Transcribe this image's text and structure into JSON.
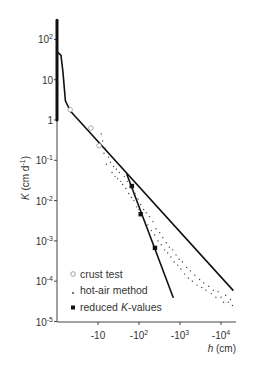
{
  "chart_data": {
    "type": "scatter",
    "title": "",
    "xlabel": "h (cm)",
    "ylabel": "K (cm d-1)",
    "xscale": "log (negative pressure head)",
    "yscale": "log",
    "xlim_abs_h": [
      1,
      22000
    ],
    "ylim": [
      1e-05,
      300
    ],
    "grid": false,
    "legend_position": "bottom-left",
    "x_ticks": [
      {
        "value": 10,
        "base": "-10",
        "exp": ""
      },
      {
        "value": 100,
        "base": "-10",
        "exp": "2"
      },
      {
        "value": 1000,
        "base": "-10",
        "exp": "3"
      },
      {
        "value": 10000,
        "base": "-10",
        "exp": "4"
      }
    ],
    "y_ticks": [
      {
        "value": 100,
        "base": "10",
        "exp": "2"
      },
      {
        "value": 10,
        "base": "10",
        "exp": ""
      },
      {
        "value": 1,
        "base": "1",
        "exp": ""
      },
      {
        "value": 0.1,
        "base": "10",
        "exp": "-1"
      },
      {
        "value": 0.01,
        "base": "10",
        "exp": "-2"
      },
      {
        "value": 0.001,
        "base": "10",
        "exp": "-3"
      },
      {
        "value": 0.0001,
        "base": "10",
        "exp": "-4"
      },
      {
        "value": 1e-05,
        "base": "10",
        "exp": "-5"
      }
    ],
    "ylabel_parts": {
      "k": "K",
      "unit": " (cm d",
      "exp": "-1",
      "close": ")"
    },
    "xlabel_parts": {
      "h": "h",
      "unit": " (cm)"
    },
    "series": [
      {
        "name": "saturated K (near h = 0)",
        "kind": "line",
        "points": [
          [
            1,
            300
          ],
          [
            1,
            1
          ]
        ]
      },
      {
        "name": "wet-range curve",
        "kind": "line",
        "points": [
          [
            1,
            50
          ],
          [
            1.25,
            40
          ],
          [
            1.4,
            15
          ],
          [
            1.6,
            3
          ],
          [
            1.9,
            2.1
          ],
          [
            2.2,
            1.6
          ]
        ]
      },
      {
        "name": "fitted line (hot-air method)",
        "kind": "line",
        "points": [
          [
            2.2,
            1.6
          ],
          [
            19500,
            6e-05
          ]
        ]
      },
      {
        "name": "fitted line (reduced K-values)",
        "kind": "line",
        "points": [
          [
            51,
            0.044
          ],
          [
            680,
            4e-05
          ]
        ]
      },
      {
        "name": "crust test",
        "kind": "marker",
        "marker": "open-circle",
        "points": [
          [
            2.1,
            1.8
          ],
          [
            6.7,
            0.63
          ],
          [
            10.6,
            0.23
          ]
        ]
      },
      {
        "name": "reduced K-values",
        "kind": "marker",
        "marker": "filled-square",
        "points": [
          [
            67,
            0.023
          ],
          [
            110,
            0.0046
          ],
          [
            245,
            0.00067
          ]
        ]
      },
      {
        "name": "hot-air method",
        "kind": "marker",
        "marker": "dot",
        "points": [
          [
            12,
            0.45
          ],
          [
            13,
            0.3
          ],
          [
            14,
            0.15
          ],
          [
            15,
            0.2
          ],
          [
            16,
            0.08
          ],
          [
            18,
            0.12
          ],
          [
            20,
            0.09
          ],
          [
            22,
            0.05
          ],
          [
            24,
            0.07
          ],
          [
            26,
            0.04
          ],
          [
            28,
            0.06
          ],
          [
            30,
            0.035
          ],
          [
            33,
            0.05
          ],
          [
            36,
            0.03
          ],
          [
            40,
            0.025
          ],
          [
            44,
            0.04
          ],
          [
            48,
            0.02
          ],
          [
            52,
            0.03
          ],
          [
            56,
            0.015
          ],
          [
            60,
            0.022
          ],
          [
            65,
            0.012
          ],
          [
            70,
            0.018
          ],
          [
            75,
            0.01
          ],
          [
            80,
            0.015
          ],
          [
            88,
            0.007
          ],
          [
            95,
            0.011
          ],
          [
            100,
            0.006
          ],
          [
            110,
            0.008
          ],
          [
            120,
            0.004
          ],
          [
            130,
            0.006
          ],
          [
            140,
            0.003
          ],
          [
            150,
            0.005
          ],
          [
            165,
            0.0025
          ],
          [
            180,
            0.004
          ],
          [
            200,
            0.0018
          ],
          [
            220,
            0.003
          ],
          [
            240,
            0.0014
          ],
          [
            260,
            0.002
          ],
          [
            290,
            0.001
          ],
          [
            320,
            0.0016
          ],
          [
            350,
            0.0008
          ],
          [
            380,
            0.0012
          ],
          [
            420,
            0.0006
          ],
          [
            460,
            0.0009
          ],
          [
            500,
            0.0005
          ],
          [
            550,
            0.0007
          ],
          [
            600,
            0.0004
          ],
          [
            660,
            0.0006
          ],
          [
            720,
            0.0003
          ],
          [
            800,
            0.00045
          ],
          [
            880,
            0.00025
          ],
          [
            950,
            0.00035
          ],
          [
            1050,
            0.0002
          ],
          [
            1150,
            0.0003
          ],
          [
            1300,
            0.00015
          ],
          [
            1450,
            0.00022
          ],
          [
            1600,
            0.00012
          ],
          [
            1800,
            0.00018
          ],
          [
            2000,
            0.0001
          ],
          [
            2300,
            0.00014
          ],
          [
            2600,
            8e-05
          ],
          [
            3000,
            0.00011
          ],
          [
            3400,
            7e-05
          ],
          [
            3800,
            9e-05
          ],
          [
            4300,
            6e-05
          ],
          [
            5000,
            7.5e-05
          ],
          [
            5800,
            5e-05
          ],
          [
            6500,
            6e-05
          ],
          [
            7500,
            4e-05
          ],
          [
            8500,
            5.5e-05
          ],
          [
            10000,
            4e-05
          ],
          [
            11500,
            3e-05
          ],
          [
            13000,
            4.5e-05
          ],
          [
            15000,
            3e-05
          ],
          [
            17000,
            3.5e-05
          ],
          [
            19000,
            2.5e-05
          ]
        ]
      }
    ],
    "legend": [
      {
        "label": "crust test",
        "marker": "open-circle"
      },
      {
        "label": "hot-air method",
        "marker": "dot"
      },
      {
        "label_pre": "reduced ",
        "label_italic": "K",
        "label_post": "-values",
        "marker": "filled-square"
      }
    ]
  }
}
